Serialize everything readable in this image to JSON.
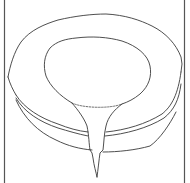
{
  "figure": {
    "colors": {
      "background": "#ffffff",
      "line": "#3a3a3a",
      "border": "#555555"
    }
  }
}
